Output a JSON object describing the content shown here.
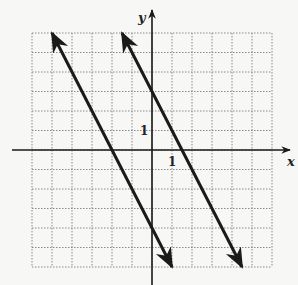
{
  "chart_data": {
    "type": "line",
    "title": "",
    "xlabel": "x",
    "ylabel": "y",
    "xlim": [
      -6,
      6
    ],
    "ylim": [
      -6,
      6
    ],
    "grid": true,
    "grid_style": "dotted",
    "tick_labels": {
      "x": [
        "1"
      ],
      "y": [
        "1"
      ]
    },
    "series": [
      {
        "name": "line-left",
        "equation": "y = -2x - 4",
        "x": [
          -5,
          1
        ],
        "y": [
          6,
          -6
        ],
        "arrows": "both"
      },
      {
        "name": "line-right",
        "equation": "y = -2x + 3",
        "x": [
          -1.5,
          4.5
        ],
        "y": [
          6,
          -6
        ],
        "arrows": "both"
      }
    ],
    "colors": {
      "line": "#1a1a1a",
      "grid": "#8a8a8a",
      "axis": "#1a1a1a",
      "background": "#f7f7f5"
    }
  },
  "labels": {
    "x_axis": "x",
    "y_axis": "y",
    "x_tick": "1",
    "y_tick": "1"
  }
}
